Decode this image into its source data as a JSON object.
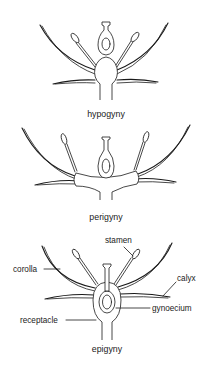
{
  "diagrams": [
    {
      "id": "hypogyny",
      "caption": "hypogyny"
    },
    {
      "id": "perigyny",
      "caption": "perigyny"
    },
    {
      "id": "epigyny",
      "caption": "epigyny"
    }
  ],
  "labels": {
    "stamen": "stamen",
    "corolla": "corolla",
    "calyx": "calyx",
    "gynoecium": "gynoecium",
    "receptacle": "receptacle"
  }
}
